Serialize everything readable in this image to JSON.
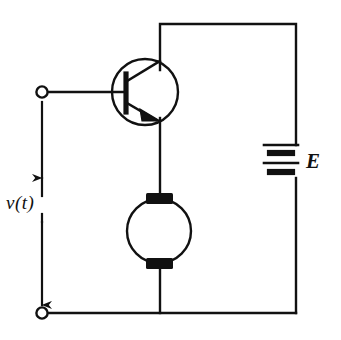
{
  "figure": {
    "kind": "electrical-schematic",
    "width": 341,
    "height": 340,
    "background_color": "#ffffff",
    "ink_color": "#111111",
    "line_width": 2.4
  },
  "labels": {
    "input_voltage": "v(t)",
    "supply_voltage": "E"
  },
  "components": [
    {
      "id": "transistor",
      "name": "npn-bipolar-transistor",
      "type": "BJT-NPN",
      "center": [
        145,
        92
      ],
      "radius": 33,
      "terminals": {
        "base": "left",
        "collector": "upper-right",
        "emitter": "lower-right"
      }
    },
    {
      "id": "motor",
      "name": "dc-motor",
      "type": "motor",
      "center": [
        159,
        231
      ],
      "radius": 32,
      "brushes": [
        "top",
        "bottom"
      ]
    },
    {
      "id": "battery",
      "name": "dc-voltage-source",
      "type": "battery",
      "label": "E",
      "center": [
        281,
        161
      ],
      "cells": 2,
      "plates": 4
    },
    {
      "id": "terminal-top",
      "name": "input-terminal-positive",
      "type": "open-terminal",
      "position": [
        42,
        92
      ]
    },
    {
      "id": "terminal-bottom",
      "name": "input-terminal-negative",
      "type": "open-terminal",
      "position": [
        42,
        313
      ]
    },
    {
      "id": "arrow-vt",
      "name": "voltage-arrow",
      "type": "double-headed-arrow",
      "from": [
        42,
        96
      ],
      "to": [
        42,
        309
      ],
      "label": "v(t)"
    }
  ],
  "wires": [
    {
      "name": "base-wire",
      "path": "42,92 -> 125,92"
    },
    {
      "name": "collector-wire",
      "path": "160,70 -> 160,24"
    },
    {
      "name": "supply-top-rail",
      "path": "160,24 -> 296,24"
    },
    {
      "name": "supply-right-rail",
      "path": "296,24 -> 296,145"
    },
    {
      "name": "supply-right-rail-lower",
      "path": "296,178 -> 296,313"
    },
    {
      "name": "emitter-wire",
      "path": "160,120 -> 160,194"
    },
    {
      "name": "motor-bottom-wire",
      "path": "160,268 -> 160,313"
    },
    {
      "name": "ground-rail",
      "path": "42,313 -> 296,313"
    }
  ]
}
